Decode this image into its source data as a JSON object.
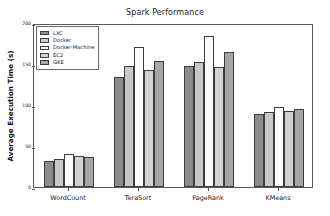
{
  "chart_data": {
    "type": "bar",
    "title": "Spark Performance",
    "xlabel": "",
    "ylabel": "Average Execution Time (s)",
    "categories": [
      "WordCount",
      "TeraSort",
      "PageRank",
      "KMeans"
    ],
    "series": [
      {
        "name": "LXC",
        "color": "#8c8c8c",
        "values": [
          32,
          134,
          147,
          89
        ]
      },
      {
        "name": "Docker",
        "color": "#c8c8c8",
        "values": [
          34,
          148,
          152,
          91
        ]
      },
      {
        "name": "Docker-Machine",
        "color": "#fbfbfb",
        "values": [
          40,
          171,
          184,
          97
        ]
      },
      {
        "name": "EC2",
        "color": "#d2d2d2",
        "values": [
          38,
          143,
          146,
          93
        ]
      },
      {
        "name": "GKE",
        "color": "#a6a6a6",
        "values": [
          37,
          154,
          165,
          95
        ]
      }
    ],
    "ylim": [
      0,
      200
    ],
    "yticks": [
      0,
      50,
      100,
      150,
      200
    ],
    "ytick_labels": [
      "0",
      "50",
      "100",
      "150",
      "200"
    ],
    "grid": false,
    "legend_position": "upper left"
  }
}
